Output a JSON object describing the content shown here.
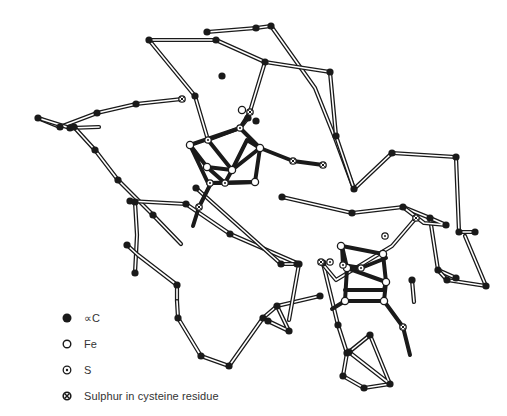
{
  "figure": {
    "colors": {
      "ink": "#1a1a1a",
      "bond_fill": "#ffffff",
      "background": "#ffffff"
    }
  },
  "legend": {
    "items": [
      {
        "symbol": "filled-circle",
        "label": "∝C"
      },
      {
        "symbol": "open-circle",
        "label": "Fe"
      },
      {
        "symbol": "dot-circle",
        "label": "S"
      },
      {
        "symbol": "cross-circle",
        "label": "Sulphur in cysteine residue"
      }
    ]
  },
  "backbone": {
    "nodes": [
      [
        203,
        32
      ],
      [
        255,
        28
      ],
      [
        271,
        26
      ],
      [
        244,
        93
      ],
      [
        176,
        52
      ],
      [
        149,
        39
      ],
      [
        84,
        41
      ],
      [
        70,
        105
      ],
      [
        30,
        118
      ],
      [
        60,
        130
      ],
      [
        102,
        127
      ],
      [
        118,
        181
      ],
      [
        150,
        210
      ],
      [
        130,
        200
      ],
      [
        129,
        242
      ],
      [
        136,
        270
      ],
      [
        176,
        285
      ],
      [
        196,
        354
      ],
      [
        233,
        365
      ],
      [
        266,
        320
      ],
      [
        300,
        262
      ],
      [
        345,
        282
      ],
      [
        290,
        239
      ],
      [
        278,
        199
      ],
      [
        205,
        213
      ],
      [
        236,
        232
      ],
      [
        276,
        354
      ],
      [
        291,
        387
      ],
      [
        345,
        396
      ],
      [
        376,
        382
      ],
      [
        355,
        352
      ],
      [
        405,
        314
      ],
      [
        404,
        301
      ],
      [
        322,
        260
      ],
      [
        264,
        270
      ],
      [
        190,
        268
      ]
    ],
    "chain_edges": [
      [
        0,
        1
      ],
      [
        1,
        2
      ],
      [
        2,
        3
      ],
      [
        4,
        5
      ],
      [
        5,
        6
      ],
      [
        6,
        7
      ],
      [
        7,
        8
      ],
      [
        8,
        9
      ],
      [
        9,
        10
      ]
    ]
  },
  "paths": {
    "double_bonds": [
      "M207,32 L256,28 L271,26",
      "M271,26 L315,88 L335,138 L354,189 L392,153 L456,157 L459,232 L475,232",
      "M149,40 L216,40 L265,62 L330,72 L336,136 L354,189",
      "M149,40 L195,96 L208,140",
      "M265,62 L248,118 L240,128",
      "M38,118 L60,127 L97,113 L136,104 L182,99",
      "M38,118 L70,128 L99,127",
      "M74,127 L95,150 L118,180 L153,215 L181,244",
      "M130,201 L186,204 L230,234 L299,264",
      "M135,202 L137,235 L135,273",
      "M127,245 L138,255 L177,285 L177,301",
      "M177,301 L178,318 L201,356 L229,366 L263,318 L277,306 L320,296",
      "M277,306 L289,331 L268,321",
      "M196,188 L281,264 L297,264",
      "M299,264 L289,320",
      "M282,197 L352,213 L403,207 L430,218 L438,270 L456,278",
      "M403,207 L424,223 L446,225 L430,218",
      "M465,236 L486,286 L447,280 L438,270",
      "M323,263 L338,325 L347,353 L343,376 L364,388 L390,384",
      "M390,384 L349,352 L370,335 L390,384",
      "M414,302 L412,280",
      "M321,262 L336,280 L392,246 L416,218"
    ],
    "thick_bonds": [
      "M208,140 L240,128 L260,148 L232,170 Z",
      "M190,145 L240,128 M190,145 L207,167 L232,170 M190,145 L208,183 L255,182 L260,148",
      "M207,167 L225,183 L208,183 M225,183 L232,170 M225,183 L255,182",
      "M240,128 L250,112 M232,170 L247,140 L260,148",
      "M211,183 L199,207 L193,226",
      "M260,148 L293,161 L323,165",
      "M342,246 L383,254 L386,258 L361,268 L343,265 Z",
      "M342,246 L347,268 L345,301 L384,301 L386,282 L383,254",
      "M347,268 L386,282 M345,290 L384,290 L386,282",
      "M384,301 L403,327 L410,355 M345,301 L332,309"
    ]
  },
  "atoms": {
    "alpha_carbon": [
      [
        207,
        32
      ],
      [
        256,
        28
      ],
      [
        271,
        26
      ],
      [
        149,
        40
      ],
      [
        216,
        40
      ],
      [
        265,
        62
      ],
      [
        330,
        72
      ],
      [
        336,
        136
      ],
      [
        354,
        189
      ],
      [
        392,
        153
      ],
      [
        456,
        157
      ],
      [
        459,
        232
      ],
      [
        475,
        232
      ],
      [
        195,
        96
      ],
      [
        222,
        76
      ],
      [
        248,
        118
      ],
      [
        38,
        118
      ],
      [
        60,
        127
      ],
      [
        97,
        113
      ],
      [
        136,
        104
      ],
      [
        70,
        128
      ],
      [
        74,
        127
      ],
      [
        95,
        150
      ],
      [
        118,
        180
      ],
      [
        153,
        215
      ],
      [
        130,
        201
      ],
      [
        186,
        204
      ],
      [
        135,
        202
      ],
      [
        127,
        245
      ],
      [
        135,
        273
      ],
      [
        177,
        285
      ],
      [
        178,
        318
      ],
      [
        201,
        356
      ],
      [
        229,
        366
      ],
      [
        263,
        318
      ],
      [
        277,
        306
      ],
      [
        320,
        296
      ],
      [
        289,
        331
      ],
      [
        268,
        321
      ],
      [
        196,
        188
      ],
      [
        281,
        264
      ],
      [
        230,
        234
      ],
      [
        282,
        197
      ],
      [
        352,
        213
      ],
      [
        403,
        207
      ],
      [
        430,
        218
      ],
      [
        438,
        270
      ],
      [
        446,
        225
      ],
      [
        456,
        278
      ],
      [
        486,
        286
      ],
      [
        447,
        280
      ],
      [
        323,
        263
      ],
      [
        338,
        325
      ],
      [
        347,
        353
      ],
      [
        343,
        376
      ],
      [
        364,
        388
      ],
      [
        390,
        384
      ],
      [
        349,
        352
      ],
      [
        370,
        335
      ],
      [
        412,
        280
      ],
      [
        256,
        121
      ],
      [
        297,
        264
      ],
      [
        299,
        264
      ]
    ],
    "iron": [
      [
        190,
        145
      ],
      [
        260,
        148
      ],
      [
        207,
        167
      ],
      [
        255,
        182
      ],
      [
        232,
        170
      ],
      [
        242,
        110
      ],
      [
        341,
        246
      ],
      [
        383,
        254
      ],
      [
        347,
        268
      ],
      [
        386,
        282
      ],
      [
        345,
        301
      ],
      [
        384,
        301
      ]
    ],
    "sulphur": [
      [
        208,
        140
      ],
      [
        240,
        128
      ],
      [
        225,
        183
      ],
      [
        210,
        183
      ],
      [
        343,
        265
      ],
      [
        361,
        268
      ],
      [
        330,
        262
      ],
      [
        385,
        236
      ]
    ],
    "cysteine_sulphur": [
      [
        182,
        99
      ],
      [
        250,
        112
      ],
      [
        293,
        161
      ],
      [
        323,
        165
      ],
      [
        199,
        207
      ],
      [
        403,
        327
      ],
      [
        321,
        262
      ],
      [
        416,
        218
      ]
    ]
  }
}
